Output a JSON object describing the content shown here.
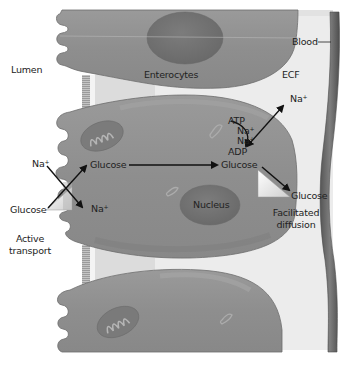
{
  "figure": {
    "type": "biology-diagram",
    "colors": {
      "cell": "#8f8f8f",
      "cell_edge": "#6d6d6d",
      "cell_highlight": "#a9a9a9",
      "ecf": "#e8e8e8",
      "ecf_inner": "#dedede",
      "blood_vessel": "#6e6e6e",
      "blood_vessel_edge": "#4e4e4e",
      "nucleus": "#767676",
      "tight_junction": "#a6a6a6",
      "transporter": "#f2f2f2",
      "arrow": "#111111"
    }
  },
  "labels": {
    "lumen": "Lumen",
    "enterocytes": "Enterocytes",
    "blood": "Blood",
    "ecf": "ECF",
    "na_out": "Na",
    "atp": "ATP",
    "na_pump_1": "Na",
    "na_pump_2": "Na",
    "adp": "ADP",
    "na_left": "Na",
    "glucose_in_cell": "Glucose",
    "glucose_basolateral": "Glucose",
    "glucose_lumen": "Glucose",
    "na_in_cell": "Na",
    "nucleus": "Nucleus",
    "glucose_ecf": "Glucose",
    "facilitated_diffusion_line1": "Facilitated",
    "facilitated_diffusion_line2": "diffusion",
    "active_transport_line1": "Active",
    "active_transport_line2": "transport",
    "plus": "+"
  }
}
